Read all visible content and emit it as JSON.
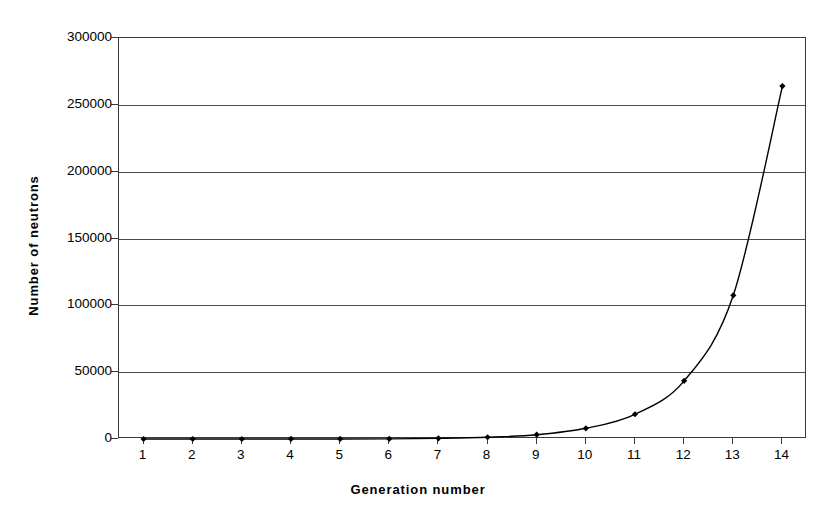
{
  "chart_data": {
    "type": "line",
    "title": "",
    "subtitle": "",
    "xlabel": "Generation  number",
    "ylabel": "Number  of  neutrons",
    "x": [
      1,
      2,
      3,
      4,
      5,
      6,
      7,
      8,
      9,
      10,
      11,
      12,
      13,
      14
    ],
    "values": [
      1,
      3,
      8,
      20,
      50,
      125,
      500,
      1300,
      3200,
      8000,
      18500,
      43500,
      107500,
      264000
    ],
    "series": [
      {
        "name": "Number of neutrons",
        "values": [
          1,
          3,
          8,
          20,
          50,
          125,
          500,
          1300,
          3200,
          8000,
          18500,
          43500,
          107500,
          264000
        ]
      }
    ],
    "xlim": [
      0.5,
      14.5
    ],
    "ylim": [
      0,
      300000
    ],
    "xticks": [
      1,
      2,
      3,
      4,
      5,
      6,
      7,
      8,
      9,
      10,
      11,
      12,
      13,
      14
    ],
    "xtick_labels": [
      "1",
      "2",
      "3",
      "4",
      "5",
      "6",
      "7",
      "8",
      "9",
      "10",
      "11",
      "12",
      "13",
      "14"
    ],
    "yticks": [
      0,
      50000,
      100000,
      150000,
      200000,
      250000,
      300000
    ],
    "ytick_labels": [
      "0",
      "50000",
      "100000",
      "150000",
      "200000",
      "250000",
      "300000"
    ],
    "grid": "horizontal",
    "legend": "none",
    "marker": "diamond",
    "line_color": "#000000",
    "marker_color": "#000000",
    "grid_color": "#4a4a4a",
    "background_color": "#ffffff"
  }
}
